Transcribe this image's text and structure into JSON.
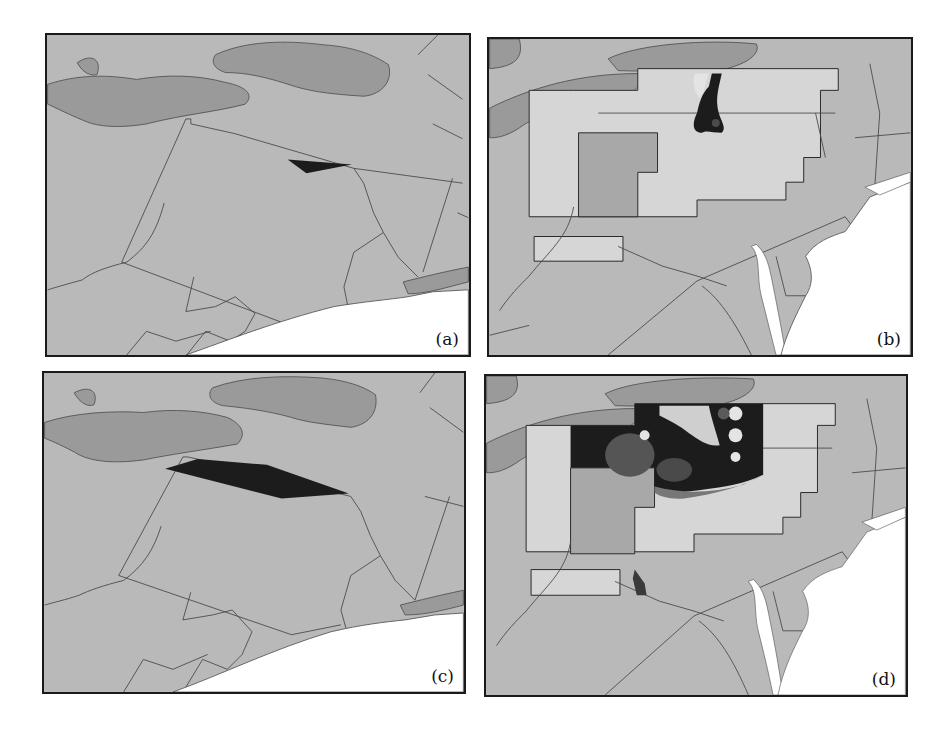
{
  "figure": {
    "panels": [
      {
        "id": "a",
        "label": "(a)",
        "content": "Outline map with small dark plume footprint"
      },
      {
        "id": "b",
        "label": "(b)",
        "content": "Gridded domain with small dark concentration field"
      },
      {
        "id": "c",
        "label": "(c)",
        "content": "Outline map with large dark plume footprint"
      },
      {
        "id": "d",
        "label": "(d)",
        "content": "Gridded domain with large dark concentration field"
      }
    ]
  },
  "colors": {
    "land": "#b9b9b9",
    "lake": "#9a9a9a",
    "ocean": "#ffffff",
    "border": "#3a3a3a",
    "domain_light": "#d6d6d6",
    "domain_mid": "#a8a8a8",
    "plume": "#1c1c1c"
  }
}
